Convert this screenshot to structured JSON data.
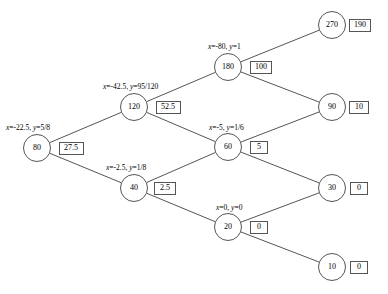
{
  "diagram": {
    "node_shape": "circle",
    "box_shape": "rectangle",
    "line_color": "#555555",
    "background": "#ffffff",
    "nodes": [
      {
        "id": "n80",
        "label": "80",
        "cx": 37,
        "cy": 148,
        "r": 14
      },
      {
        "id": "n120",
        "label": "120",
        "cx": 134,
        "cy": 107,
        "r": 14
      },
      {
        "id": "n40",
        "label": "40",
        "cx": 134,
        "cy": 188,
        "r": 14
      },
      {
        "id": "n180",
        "label": "180",
        "cx": 228,
        "cy": 67,
        "r": 14
      },
      {
        "id": "n60",
        "label": "60",
        "cx": 228,
        "cy": 147,
        "r": 14
      },
      {
        "id": "n20",
        "label": "20",
        "cx": 228,
        "cy": 227,
        "r": 14
      },
      {
        "id": "n270",
        "label": "270",
        "cx": 332,
        "cy": 25,
        "r": 14
      },
      {
        "id": "n90",
        "label": "90",
        "cx": 332,
        "cy": 107,
        "r": 14
      },
      {
        "id": "n30",
        "label": "30",
        "cx": 332,
        "cy": 188,
        "r": 14
      },
      {
        "id": "n10",
        "label": "10",
        "cx": 332,
        "cy": 267,
        "r": 14
      }
    ],
    "boxes": [
      {
        "id": "b80",
        "label": "27.5",
        "node": "n80",
        "cx": 71,
        "cy": 148,
        "w": 25,
        "h": 13
      },
      {
        "id": "b120",
        "label": "52.5",
        "node": "n120",
        "cx": 168,
        "cy": 107,
        "w": 25,
        "h": 13
      },
      {
        "id": "b40",
        "label": "2.5",
        "node": "n40",
        "cx": 165,
        "cy": 188,
        "w": 22,
        "h": 13
      },
      {
        "id": "b180",
        "label": "100",
        "node": "n180",
        "cx": 261,
        "cy": 67,
        "w": 22,
        "h": 13
      },
      {
        "id": "b60",
        "label": "5",
        "node": "n60",
        "cx": 259,
        "cy": 147,
        "w": 18,
        "h": 13
      },
      {
        "id": "b20",
        "label": "0",
        "node": "n20",
        "cx": 259,
        "cy": 227,
        "w": 18,
        "h": 13
      },
      {
        "id": "b270",
        "label": "190",
        "node": "n270",
        "cx": 360,
        "cy": 25,
        "w": 22,
        "h": 13
      },
      {
        "id": "b90",
        "label": "10",
        "node": "n90",
        "cx": 359,
        "cy": 107,
        "w": 20,
        "h": 13
      },
      {
        "id": "b30",
        "label": "0",
        "node": "n30",
        "cx": 359,
        "cy": 188,
        "w": 18,
        "h": 13
      },
      {
        "id": "b10",
        "label": "0",
        "node": "n10",
        "cx": 359,
        "cy": 267,
        "w": 18,
        "h": 13
      }
    ],
    "equation_labels": [
      {
        "id": "eq80",
        "node": "n80",
        "x_part": "x",
        "text": "=-22.5, ",
        "y_part": "y",
        "y_text": "=5/8",
        "full": "x=-22.5, y=5/8",
        "left": 6,
        "top": 124
      },
      {
        "id": "eq120",
        "node": "n120",
        "x_part": "x",
        "text": "=-42.5, ",
        "y_part": "y",
        "y_text": "=95/120",
        "full": "x=-42.5, y=95/120",
        "left": 103,
        "top": 83
      },
      {
        "id": "eq180",
        "node": "n180",
        "x_part": "x",
        "text": "=-80, ",
        "y_part": "y",
        "y_text": "=1",
        "full": "x=-80, y=1",
        "left": 208,
        "top": 43
      },
      {
        "id": "eq60",
        "node": "n60",
        "x_part": "x",
        "text": "=-5, ",
        "y_part": "y",
        "y_text": "=1/6",
        "full": "x=-5, y=1/6",
        "left": 209,
        "top": 124
      },
      {
        "id": "eq40",
        "node": "n40",
        "x_part": "x",
        "text": "=-2.5, ",
        "y_part": "y",
        "y_text": "=1/8",
        "full": "x=-2.5, y=1/8",
        "left": 106,
        "top": 164
      },
      {
        "id": "eq20",
        "node": "n20",
        "x_part": "x",
        "text": "=0, ",
        "y_part": "y",
        "y_text": "=0",
        "full": "x=0, y=0",
        "left": 216,
        "top": 204
      }
    ],
    "edges": [
      {
        "from": "n80",
        "to": "n120"
      },
      {
        "from": "n80",
        "to": "n40"
      },
      {
        "from": "n120",
        "to": "n180"
      },
      {
        "from": "n120",
        "to": "n60"
      },
      {
        "from": "n40",
        "to": "n60"
      },
      {
        "from": "n40",
        "to": "n20"
      },
      {
        "from": "n180",
        "to": "n270"
      },
      {
        "from": "n180",
        "to": "n90"
      },
      {
        "from": "n60",
        "to": "n90"
      },
      {
        "from": "n60",
        "to": "n30"
      },
      {
        "from": "n20",
        "to": "n30"
      },
      {
        "from": "n20",
        "to": "n10"
      }
    ]
  }
}
